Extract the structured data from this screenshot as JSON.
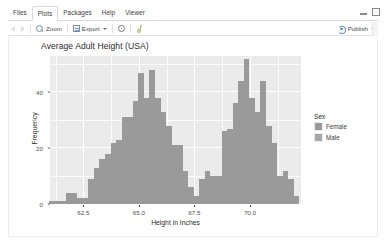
{
  "window": {
    "minimize_icon": "minimize-icon",
    "maximize_icon": "maximize-icon"
  },
  "tabs": [
    {
      "label": "Files",
      "active": false
    },
    {
      "label": "Plots",
      "active": true
    },
    {
      "label": "Packages",
      "active": false
    },
    {
      "label": "Help",
      "active": false
    },
    {
      "label": "Viewer",
      "active": false
    }
  ],
  "toolbar": {
    "back_icon": "back-arrow-icon",
    "forward_icon": "forward-arrow-icon",
    "zoom_label": "Zoom",
    "zoom_icon": "magnifier-icon",
    "export_label": "Export",
    "export_icon": "export-icon",
    "export_caret": "chevron-down-icon",
    "remove_icon": "gear-icon",
    "clear_icon": "broom-icon",
    "publish_label": "Publish",
    "publish_icon": "publish-icon",
    "publish_caret": "chevron-down-icon"
  },
  "colors": {
    "panel_background": "#ebebeb",
    "gridline": "#ffffff",
    "bar_fill": "#9a9a9a",
    "female_swatch": "#9a9a9a",
    "male_swatch": "#a8a8a8",
    "axis_text": "#4d4d4d",
    "title_text": "#2b2b2b"
  },
  "chart_data": {
    "type": "bar",
    "chart_subtype": "histogram",
    "title": "Average Adult Height (USA)",
    "xlabel": "Height in Inches",
    "ylabel": "Frequency",
    "xlim": [
      61.0,
      72.3
    ],
    "ylim": [
      0,
      53
    ],
    "xticks": [
      62.5,
      65.0,
      67.5,
      70.0
    ],
    "xtick_labels": [
      "62.5",
      "65.0",
      "67.5",
      "70.0"
    ],
    "yticks": [
      0,
      20,
      40
    ],
    "ytick_labels": [
      "0",
      "20",
      "40"
    ],
    "grid": true,
    "legend": {
      "title": "Sex",
      "position": "right",
      "entries": [
        {
          "label": "Female",
          "color": "#9a9a9a"
        },
        {
          "label": "Male",
          "color": "#a8a8a8"
        }
      ]
    },
    "bin_width": 0.25,
    "bins": [
      {
        "x": 61.1,
        "value": 1
      },
      {
        "x": 61.35,
        "value": 1
      },
      {
        "x": 61.6,
        "value": 1
      },
      {
        "x": 61.85,
        "value": 4
      },
      {
        "x": 62.1,
        "value": 4
      },
      {
        "x": 62.35,
        "value": 2
      },
      {
        "x": 62.6,
        "value": 2
      },
      {
        "x": 62.85,
        "value": 9
      },
      {
        "x": 63.1,
        "value": 13
      },
      {
        "x": 63.35,
        "value": 16
      },
      {
        "x": 63.6,
        "value": 18
      },
      {
        "x": 63.85,
        "value": 22
      },
      {
        "x": 64.1,
        "value": 23
      },
      {
        "x": 64.35,
        "value": 31
      },
      {
        "x": 64.6,
        "value": 31
      },
      {
        "x": 64.85,
        "value": 37
      },
      {
        "x": 65.1,
        "value": 47
      },
      {
        "x": 65.35,
        "value": 38
      },
      {
        "x": 65.6,
        "value": 48
      },
      {
        "x": 65.85,
        "value": 38
      },
      {
        "x": 66.1,
        "value": 33
      },
      {
        "x": 66.35,
        "value": 28
      },
      {
        "x": 66.6,
        "value": 21
      },
      {
        "x": 66.85,
        "value": 21
      },
      {
        "x": 67.1,
        "value": 12
      },
      {
        "x": 67.35,
        "value": 6
      },
      {
        "x": 67.6,
        "value": 3
      },
      {
        "x": 67.85,
        "value": 9
      },
      {
        "x": 68.1,
        "value": 12
      },
      {
        "x": 68.35,
        "value": 10
      },
      {
        "x": 68.6,
        "value": 10
      },
      {
        "x": 68.85,
        "value": 26
      },
      {
        "x": 69.1,
        "value": 27
      },
      {
        "x": 69.35,
        "value": 36
      },
      {
        "x": 69.6,
        "value": 44
      },
      {
        "x": 69.85,
        "value": 52
      },
      {
        "x": 70.1,
        "value": 38
      },
      {
        "x": 70.35,
        "value": 33
      },
      {
        "x": 70.6,
        "value": 44
      },
      {
        "x": 70.85,
        "value": 28
      },
      {
        "x": 71.1,
        "value": 22
      },
      {
        "x": 71.35,
        "value": 10
      },
      {
        "x": 71.6,
        "value": 12
      },
      {
        "x": 71.85,
        "value": 9
      },
      {
        "x": 72.1,
        "value": 3
      }
    ]
  }
}
